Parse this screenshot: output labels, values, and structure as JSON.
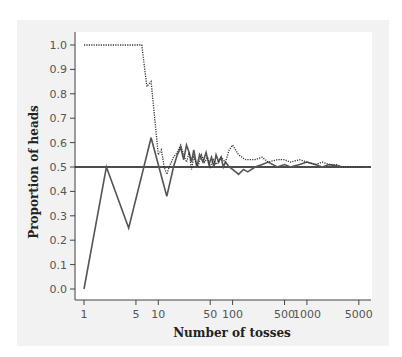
{
  "chart_data": {
    "type": "line",
    "title": "",
    "xlabel": "Number of tosses",
    "ylabel": "Proportion of heads",
    "xscale": "log",
    "xlim": [
      1,
      6000
    ],
    "ylim": [
      0.0,
      1.0
    ],
    "x_ticks": [
      1,
      5,
      10,
      50,
      100,
      500,
      1000,
      5000
    ],
    "x_tick_labels": [
      "1",
      "5",
      "10",
      "50",
      "100",
      "500",
      "1000",
      "5000"
    ],
    "y_ticks": [
      0.0,
      0.1,
      0.2,
      0.3,
      0.4,
      0.5,
      0.6,
      0.7,
      0.8,
      0.9,
      1.0
    ],
    "y_tick_labels": [
      "0.0",
      "0.1",
      "0.2",
      "0.3",
      "0.4",
      "0.5",
      "0.6",
      "0.7",
      "0.8",
      "0.9",
      "1.0"
    ],
    "grid": false,
    "legend": null,
    "reference_line": {
      "y": 0.5,
      "style": "solid",
      "label": ""
    },
    "series": [
      {
        "name": "Trial A (solid)",
        "style": "solid",
        "color": "#555555",
        "x": [
          1,
          2,
          4,
          8,
          13,
          16,
          18,
          20,
          22,
          24,
          26,
          28,
          30,
          33,
          36,
          40,
          44,
          48,
          52,
          56,
          60,
          65,
          70,
          75,
          80,
          90,
          100,
          110,
          120,
          140,
          160,
          200,
          250,
          300,
          400,
          500,
          600,
          800,
          1000,
          1300,
          1600,
          2000,
          2500,
          3000,
          4000,
          5000,
          6000
        ],
        "y": [
          0.0,
          0.5,
          0.25,
          0.62,
          0.38,
          0.5,
          0.55,
          0.58,
          0.53,
          0.59,
          0.56,
          0.52,
          0.57,
          0.5,
          0.55,
          0.52,
          0.56,
          0.51,
          0.54,
          0.5,
          0.55,
          0.52,
          0.54,
          0.5,
          0.52,
          0.5,
          0.49,
          0.48,
          0.47,
          0.49,
          0.48,
          0.5,
          0.51,
          0.52,
          0.5,
          0.51,
          0.5,
          0.51,
          0.52,
          0.51,
          0.5,
          0.51,
          0.505,
          0.5,
          0.5,
          0.5,
          0.5
        ]
      },
      {
        "name": "Trial B (dotted)",
        "style": "dotted",
        "color": "#333333",
        "x": [
          1,
          2,
          3,
          4,
          5,
          6,
          7,
          8,
          10,
          11,
          12,
          13,
          14,
          16,
          18,
          20,
          22,
          24,
          26,
          28,
          30,
          34,
          38,
          42,
          46,
          50,
          55,
          60,
          70,
          80,
          90,
          100,
          120,
          150,
          200,
          250,
          300,
          400,
          500,
          600,
          800,
          1000,
          1300,
          1600,
          2000,
          2500,
          3000,
          4000,
          5000,
          6000
        ],
        "y": [
          1.0,
          1.0,
          1.0,
          1.0,
          1.0,
          1.0,
          0.83,
          0.85,
          0.55,
          0.57,
          0.5,
          0.47,
          0.5,
          0.54,
          0.56,
          0.59,
          0.55,
          0.52,
          0.56,
          0.49,
          0.54,
          0.5,
          0.55,
          0.52,
          0.54,
          0.5,
          0.53,
          0.51,
          0.54,
          0.52,
          0.57,
          0.59,
          0.55,
          0.53,
          0.53,
          0.54,
          0.52,
          0.53,
          0.53,
          0.52,
          0.53,
          0.52,
          0.51,
          0.52,
          0.51,
          0.51,
          0.5,
          0.5,
          0.5,
          0.5
        ]
      }
    ]
  },
  "layout": {
    "plot_left": 75,
    "plot_right": 371,
    "x_axis_y": 300,
    "y_top": 45,
    "y_bottom": 289,
    "x_at_1": 84,
    "px_per_decade": 74.3
  }
}
